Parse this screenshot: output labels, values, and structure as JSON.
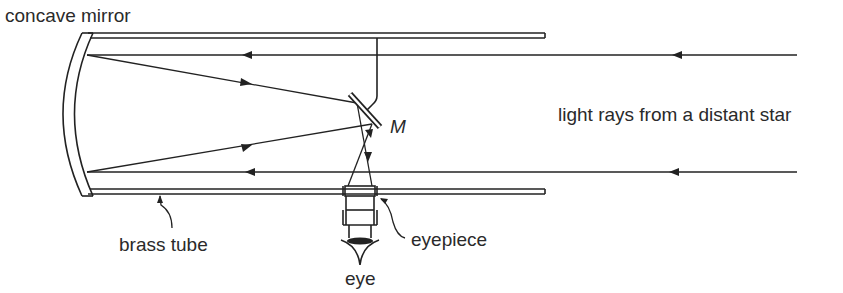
{
  "diagram": {
    "labels": {
      "concave_mirror": "concave mirror",
      "mirror_m": "M",
      "light_rays": "light rays from a distant star",
      "brass_tube": "brass tube",
      "eyepiece": "eyepiece",
      "eye": "eye"
    },
    "colors": {
      "line": "#222222",
      "text": "#2a2a2a",
      "background": "#ffffff"
    }
  }
}
